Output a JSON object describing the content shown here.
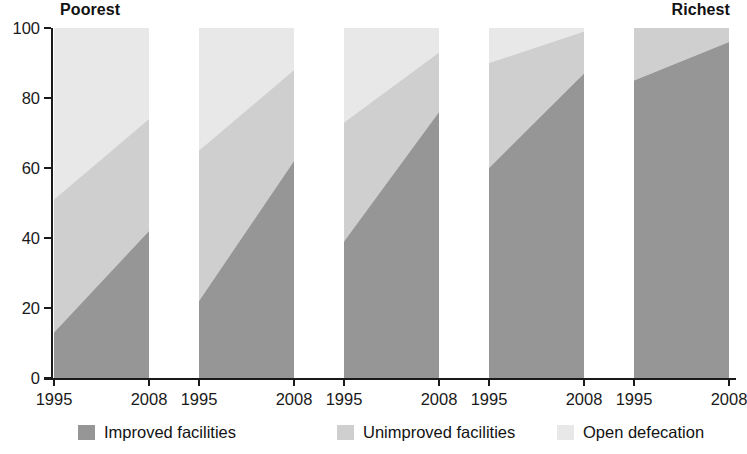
{
  "chart_data": {
    "type": "area",
    "title": "",
    "subtitle": "",
    "xlabel": "",
    "ylabel": "",
    "ylim": [
      0,
      100
    ],
    "yticks": [
      0,
      20,
      40,
      60,
      80,
      100
    ],
    "grid": false,
    "legend_position": "bottom",
    "stacked": true,
    "stack_total": 100,
    "panel_start_label": "Poorest",
    "panel_end_label": "Richest",
    "x": [
      1995,
      2008
    ],
    "xtick_labels": [
      "1995",
      "2008"
    ],
    "series": [
      {
        "name": "Improved facilities",
        "color": "#969696",
        "panels": [
          [
            13,
            42
          ],
          [
            22,
            62
          ],
          [
            39,
            76
          ],
          [
            60,
            87
          ],
          [
            85,
            96
          ]
        ]
      },
      {
        "name": "Unimproved facilities",
        "color": "#cfcfcf",
        "panels": [
          [
            38,
            32
          ],
          [
            43,
            26
          ],
          [
            34,
            17
          ],
          [
            30,
            12
          ],
          [
            15,
            4
          ]
        ]
      },
      {
        "name": "Open defecation",
        "color": "#e8e8e8",
        "panels": [
          [
            49,
            26
          ],
          [
            35,
            12
          ],
          [
            27,
            7
          ],
          [
            10,
            1
          ],
          [
            0,
            0
          ]
        ]
      }
    ],
    "panels": [
      {
        "quintile_label": "Poorest",
        "xtick_labels": [
          "1995",
          "2008"
        ],
        "improved": [
          13,
          42
        ],
        "unimproved_top": [
          51,
          74
        ],
        "open_defecation": [
          49,
          26
        ]
      },
      {
        "quintile_label": "",
        "xtick_labels": [
          "1995",
          "2008"
        ],
        "improved": [
          22,
          62
        ],
        "unimproved_top": [
          65,
          88
        ],
        "open_defecation": [
          35,
          12
        ]
      },
      {
        "quintile_label": "",
        "xtick_labels": [
          "1995",
          "2008"
        ],
        "improved": [
          39,
          76
        ],
        "unimproved_top": [
          73,
          93
        ],
        "open_defecation": [
          27,
          7
        ]
      },
      {
        "quintile_label": "",
        "xtick_labels": [
          "1995",
          "2008"
        ],
        "improved": [
          60,
          87
        ],
        "unimproved_top": [
          90,
          99
        ],
        "open_defecation": [
          10,
          1
        ]
      },
      {
        "quintile_label": "Richest",
        "xtick_labels": [
          "1995",
          "2008"
        ],
        "improved": [
          85,
          96
        ],
        "unimproved_top": [
          100,
          100
        ],
        "open_defecation": [
          0,
          0
        ]
      }
    ]
  },
  "axis": {
    "y_tick_labels": [
      "100",
      "80",
      "60",
      "40",
      "20",
      "0"
    ],
    "x_tick_labels": [
      "1995",
      "2008",
      "1995",
      "2008",
      "1995",
      "2008",
      "1995",
      "2008",
      "1995",
      "2008"
    ]
  },
  "panel_labels": {
    "poorest": "Poorest",
    "richest": "Richest"
  },
  "legend": {
    "items": [
      {
        "label": "Improved facilities",
        "color": "#969696"
      },
      {
        "label": "Unimproved facilities",
        "color": "#cfcfcf"
      },
      {
        "label": "Open defecation",
        "color": "#e8e8e8"
      }
    ]
  }
}
